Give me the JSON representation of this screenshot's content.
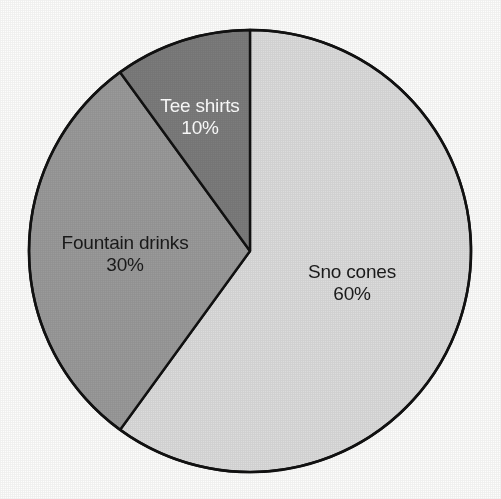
{
  "chart_data": {
    "type": "pie",
    "title": "",
    "subtitle": "",
    "xlabel": "",
    "ylabel": "",
    "legend_position": "none",
    "grid": false,
    "labels_inside_slices": true,
    "start_angle_deg": 0,
    "direction": "clockwise",
    "categories": [
      "Sno cones",
      "Fountain drinks",
      "Tee shirts"
    ],
    "values": [
      60,
      30,
      10
    ],
    "value_suffix": "%",
    "slices": [
      {
        "name": "Sno cones",
        "value": 60,
        "value_label": "60%",
        "color": "#dcdcdc",
        "label_color": "#1a1a1a",
        "start_deg": 0,
        "end_deg": 216
      },
      {
        "name": "Fountain drinks",
        "value": 30,
        "value_label": "30%",
        "color": "#9a9a9a",
        "label_color": "#1a1a1a",
        "start_deg": 216,
        "end_deg": 324
      },
      {
        "name": "Tee shirts",
        "value": 10,
        "value_label": "10%",
        "color": "#7c7c7c",
        "label_color": "#ffffff",
        "start_deg": 324,
        "end_deg": 360
      }
    ],
    "stroke_color": "#111111",
    "background_color": "#fdfdfc"
  },
  "labels": {
    "sno_cones": {
      "name": "Sno cones",
      "value": "60%"
    },
    "fountain_drinks": {
      "name": "Fountain drinks",
      "value": "30%"
    },
    "tee_shirts": {
      "name": "Tee shirts",
      "value": "10%"
    }
  }
}
